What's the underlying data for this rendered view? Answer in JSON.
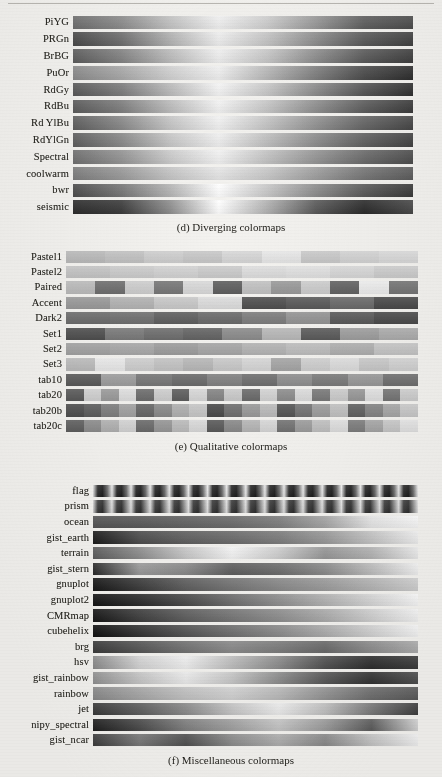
{
  "page": {
    "kind": "printed-figure-page",
    "background_hex": "#f3f2ef",
    "ink_hex": "#26251f",
    "rendering": "grayscale halftone scan of matplotlib colormap reference"
  },
  "figures": [
    {
      "id": "d",
      "caption": "(d) Diverging colormaps",
      "type": "continuous",
      "rows": [
        {
          "label": "PiYG",
          "stops": [
            "#6e6e6e",
            "#8d8d8d",
            "#c4c4c4",
            "#f2f2f2",
            "#cfcfcf",
            "#9a9a9a",
            "#5f5f5f",
            "#4d4d4d"
          ]
        },
        {
          "label": "PRGn",
          "stops": [
            "#4a4a4a",
            "#6f6f6f",
            "#b3b3b3",
            "#f0f0f0",
            "#c6c6c6",
            "#8e8e8e",
            "#5a5a5a",
            "#414141"
          ]
        },
        {
          "label": "BrBG",
          "stops": [
            "#5d5d5d",
            "#848484",
            "#bdbdbd",
            "#f1f1f1",
            "#c9c9c9",
            "#8f8f8f",
            "#5b5b5b",
            "#3f3f3f"
          ]
        },
        {
          "label": "PuOr",
          "stops": [
            "#8c8c8c",
            "#aaaaaa",
            "#d2d2d2",
            "#f1f1f1",
            "#b9b9b9",
            "#808080",
            "#4c4c4c",
            "#2e2e2e"
          ]
        },
        {
          "label": "RdGy",
          "stops": [
            "#5a5a5a",
            "#7d7d7d",
            "#bcbcbc",
            "#f6f6f6",
            "#c9c9c9",
            "#8d8d8d",
            "#565656",
            "#303030"
          ]
        },
        {
          "label": "RdBu",
          "stops": [
            "#5b5b5b",
            "#7f7f7f",
            "#bdbdbd",
            "#f4f4f4",
            "#c8c8c8",
            "#909090",
            "#5d5d5d",
            "#3b3b3b"
          ]
        },
        {
          "label": "Rd YlBu",
          "stops": [
            "#5f5f5f",
            "#8a8a8a",
            "#c7c7c7",
            "#f3f3f3",
            "#c6c6c6",
            "#949494",
            "#666666",
            "#474747"
          ]
        },
        {
          "label": "RdYlGn",
          "stops": [
            "#5e5e5e",
            "#8a8a8a",
            "#c8c8c8",
            "#f0f0f0",
            "#c0c0c0",
            "#8e8e8e",
            "#616161",
            "#434343"
          ]
        },
        {
          "label": "Spectral",
          "stops": [
            "#707070",
            "#959595",
            "#cccccc",
            "#f2f2f2",
            "#c4c4c4",
            "#969696",
            "#6b6b6b",
            "#4d4d4d"
          ]
        },
        {
          "label": "coolwarm",
          "stops": [
            "#7e7e7e",
            "#9b9b9b",
            "#c6c6c6",
            "#e6e6e6",
            "#c9c9c9",
            "#a0a0a0",
            "#777777",
            "#5d5d5d"
          ]
        },
        {
          "label": "bwr",
          "stops": [
            "#4c4c4c",
            "#777777",
            "#b6b6b6",
            "#ffffff",
            "#c9c9c9",
            "#8e8e8e",
            "#5a5a5a",
            "#3a3a3a"
          ]
        },
        {
          "label": "seismic",
          "stops": [
            "#2d2d2d",
            "#3c3c3c",
            "#8f8f8f",
            "#ffffff",
            "#b3b3b3",
            "#5a5a5a",
            "#2b2b2b",
            "#4a4a4a"
          ]
        }
      ]
    },
    {
      "id": "e",
      "caption": "(e) Qualitative colormaps",
      "type": "discrete",
      "rows": [
        {
          "label": "Pastel1",
          "blocks": [
            "#bcbcbc",
            "#c3c3c3",
            "#cfcfcf",
            "#c8c8c8",
            "#d7d7d7",
            "#e8e8e8",
            "#cbcbcb",
            "#d5d5d5",
            "#dcdcdc"
          ]
        },
        {
          "label": "Pastel2",
          "blocks": [
            "#c6c6c6",
            "#cdcdcd",
            "#d2d2d2",
            "#cbcbcb",
            "#dedede",
            "#e2e2e2",
            "#d9d9d9",
            "#cfcfcf"
          ]
        },
        {
          "label": "Paired",
          "blocks": [
            "#bdbdbd",
            "#6f6f6f",
            "#cfcfcf",
            "#777777",
            "#d9d9d9",
            "#5e5e5e",
            "#c2c2c2",
            "#9a9a9a",
            "#cecece",
            "#636363",
            "#efefef",
            "#767676"
          ]
        },
        {
          "label": "Accent",
          "blocks": [
            "#9b9b9b",
            "#b4b4b4",
            "#c9c9c9",
            "#dcdcdc",
            "#4f4f4f",
            "#5a5a5a",
            "#6b6b6b",
            "#4a4a4a"
          ]
        },
        {
          "label": "Dark2",
          "blocks": [
            "#6d6d6d",
            "#707070",
            "#5f5f5f",
            "#6a6a6a",
            "#7d7d7d",
            "#959595",
            "#5a5a5a",
            "#4b4b4b"
          ]
        },
        {
          "label": "Set1",
          "blocks": [
            "#4f4f4f",
            "#7a7a7a",
            "#6e6e6e",
            "#646464",
            "#8c8c8c",
            "#b9b9b9",
            "#5b5b5b",
            "#9f9f9f",
            "#aeaeae"
          ]
        },
        {
          "label": "Set2",
          "blocks": [
            "#a3a3a3",
            "#a9a9a9",
            "#9d9d9d",
            "#a6a6a6",
            "#b4b4b4",
            "#bebebe",
            "#b0b0b0",
            "#c7c7c7"
          ]
        },
        {
          "label": "Set3",
          "blocks": [
            "#bdbdbd",
            "#eaeaea",
            "#cfcfcf",
            "#c4c4c4",
            "#b8b8b8",
            "#c9c9c9",
            "#d6d6d6",
            "#a6a6a6",
            "#d0d0d0",
            "#dedede",
            "#cacaca",
            "#d4d4d4"
          ]
        },
        {
          "label": "tab10",
          "blocks": [
            "#5a5a5a",
            "#9e9e9e",
            "#777777",
            "#6b6b6b",
            "#818181",
            "#6f6f6f",
            "#8f8f8f",
            "#7b7b7b",
            "#999999",
            "#707070"
          ]
        },
        {
          "label": "tab20",
          "blocks": [
            "#5a5a5a",
            "#d2d2d2",
            "#9c9c9c",
            "#e0e0e0",
            "#6d6d6d",
            "#cfcfcf",
            "#5e5e5e",
            "#d8d8d8",
            "#858585",
            "#cbcbcb",
            "#6b6b6b",
            "#d4d4d4",
            "#8e8e8e",
            "#dddddd",
            "#7a7a7a",
            "#cdcdcd",
            "#999999",
            "#e2e2e2",
            "#767676",
            "#d0d0d0"
          ]
        },
        {
          "label": "tab20b",
          "blocks": [
            "#4e4e4e",
            "#5d5d5d",
            "#7e7e7e",
            "#a2a2a2",
            "#666666",
            "#8a8a8a",
            "#b0b0b0",
            "#c7c7c7",
            "#4a4a4a",
            "#6f6f6f",
            "#9a9a9a",
            "#bcbcbc",
            "#555555",
            "#747474",
            "#9e9e9e",
            "#c2c2c2",
            "#616161",
            "#858585",
            "#a8a8a8",
            "#cbcbcb"
          ]
        },
        {
          "label": "tab20c",
          "blocks": [
            "#5f5f5f",
            "#8d8d8d",
            "#b2b2b2",
            "#d4d4d4",
            "#6b6b6b",
            "#979797",
            "#bcbcbc",
            "#dadada",
            "#5a5a5a",
            "#8a8a8a",
            "#b6b6b6",
            "#d8d8d8",
            "#737373",
            "#9d9d9d",
            "#c1c1c1",
            "#e0e0e0",
            "#7e7e7e",
            "#a7a7a7",
            "#c9c9c9",
            "#e5e5e5"
          ]
        }
      ]
    },
    {
      "id": "f",
      "caption": "(f) Miscellaneous colormaps",
      "type": "continuous",
      "rows": [
        {
          "label": "flag",
          "repeat": 17,
          "stops": [
            "#e8e8e8",
            "#2a2a2a",
            "#1d1d1d",
            "#6a6a6a",
            "#f0f0f0"
          ]
        },
        {
          "label": "prism",
          "repeat": 17,
          "stops": [
            "#dcdcdc",
            "#3c3c3c",
            "#2e2e2e",
            "#8a8a8a",
            "#e6e6e6"
          ]
        },
        {
          "label": "ocean",
          "stops": [
            "#555555",
            "#5a5a5a",
            "#636363",
            "#6c6c6c",
            "#7e7e7e",
            "#a6a6a6",
            "#e8e8e8",
            "#fbfbfb"
          ]
        },
        {
          "label": "gist_earth",
          "stops": [
            "#1b1b1b",
            "#4d4d4d",
            "#606060",
            "#6c6c6c",
            "#7d7d7d",
            "#9a9a9a",
            "#c6c6c6",
            "#f2f2f2"
          ]
        },
        {
          "label": "terrain",
          "stops": [
            "#5d5d5d",
            "#8e8e8e",
            "#c9c9c9",
            "#f6f6f6",
            "#d0d0d0",
            "#989898",
            "#b5b5b5",
            "#eeeeee"
          ]
        },
        {
          "label": "gist_stern",
          "stops": [
            "#2a2a2a",
            "#9b9b9b",
            "#8a8a8a",
            "#5e5e5e",
            "#6d6d6d",
            "#8c8c8c",
            "#bfbfbf",
            "#f4f4f4"
          ]
        },
        {
          "label": "gnuplot",
          "stops": [
            "#171717",
            "#3b3b3b",
            "#5e5e5e",
            "#757575",
            "#8a8a8a",
            "#9d9d9d",
            "#b6b6b6",
            "#d2d2d2"
          ]
        },
        {
          "label": "gnuplot2",
          "stops": [
            "#141414",
            "#2c2c2c",
            "#4a4a4a",
            "#6e6e6e",
            "#909090",
            "#b4b4b4",
            "#d8d8d8",
            "#fafafa"
          ]
        },
        {
          "label": "CMRmap",
          "stops": [
            "#161616",
            "#3e3e3e",
            "#5e5e5e",
            "#777777",
            "#8f8f8f",
            "#adadad",
            "#d2d2d2",
            "#f6f6f6"
          ]
        },
        {
          "label": "cubehelix",
          "stops": [
            "#101010",
            "#333333",
            "#545454",
            "#707070",
            "#8c8c8c",
            "#aeaeae",
            "#d4d4d4",
            "#f8f8f8"
          ]
        },
        {
          "label": "brg",
          "stops": [
            "#3a3a3a",
            "#565656",
            "#737373",
            "#8b8b8b",
            "#7d7d7d",
            "#6a6a6a",
            "#8e8e8e",
            "#aeaeae"
          ]
        },
        {
          "label": "hsv",
          "stops": [
            "#8c8c8c",
            "#d6d6d6",
            "#f2f2f2",
            "#c0c0c0",
            "#8e8e8e",
            "#515151",
            "#2e2e2e",
            "#3c3c3c"
          ]
        },
        {
          "label": "gist_rainbow",
          "stops": [
            "#929292",
            "#c8c8c8",
            "#eeeeee",
            "#c9c9c9",
            "#8e8e8e",
            "#575757",
            "#323232",
            "#4e4e4e"
          ]
        },
        {
          "label": "rainbow",
          "stops": [
            "#8a8a8a",
            "#a8a8a8",
            "#c4c4c4",
            "#d4d4d4",
            "#bcbcbc",
            "#949494",
            "#6e6e6e",
            "#5a5a5a"
          ]
        },
        {
          "label": "jet",
          "stops": [
            "#3a3a3a",
            "#5e5e5e",
            "#8c8c8c",
            "#c8c8c8",
            "#efefef",
            "#c2c2c2",
            "#7a7a7a",
            "#3e3e3e"
          ]
        },
        {
          "label": "nipy_spectral",
          "stops": [
            "#1e1e1e",
            "#4a4a4a",
            "#808080",
            "#a2a2a2",
            "#c8c8c8",
            "#9d9d9d",
            "#5c5c5c",
            "#d6d6d6"
          ]
        },
        {
          "label": "gist_ncar",
          "stops": [
            "#3c3c3c",
            "#797979",
            "#505050",
            "#8d8d8d",
            "#b0b0b0",
            "#8a8a8a",
            "#c6c6c6",
            "#f4f4f4"
          ]
        }
      ]
    }
  ]
}
